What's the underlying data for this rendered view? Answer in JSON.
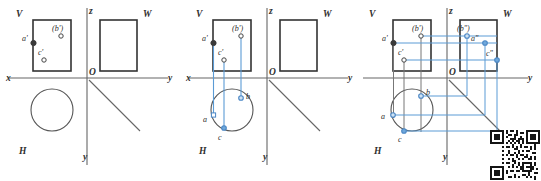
{
  "figure": {
    "type": "orthographic-projection-diagram",
    "panel_count": 3
  },
  "axis_labels": {
    "x": "x",
    "y_right": "y",
    "y_down": "y",
    "z": "z",
    "origin": "O"
  },
  "plane_labels": {
    "v": "V",
    "h": "H",
    "w": "W"
  },
  "panels": [
    {
      "id": "panel-1",
      "name": "initial-projection",
      "points": [
        {
          "id": "a-prime",
          "label": "a'",
          "style": "filled"
        },
        {
          "id": "b-prime",
          "label": "(b')",
          "style": "hollow"
        },
        {
          "id": "c-prime",
          "label": "c'",
          "style": "hollow"
        }
      ],
      "shapes": [
        "v-rectangle",
        "w-rectangle",
        "h-circle"
      ],
      "projection_lines": []
    },
    {
      "id": "panel-2",
      "name": "horizontal-projection-added",
      "points": [
        {
          "id": "a-prime",
          "label": "a'",
          "style": "filled"
        },
        {
          "id": "b-prime",
          "label": "(b')",
          "style": "hollow"
        },
        {
          "id": "c-prime",
          "label": "c'",
          "style": "hollow"
        },
        {
          "id": "a",
          "label": "a",
          "style": "blue-hollow"
        },
        {
          "id": "b",
          "label": "b",
          "style": "blue-hollow"
        },
        {
          "id": "c",
          "label": "c",
          "style": "blue-filled"
        }
      ],
      "shapes": [
        "v-rectangle",
        "w-rectangle",
        "h-circle"
      ],
      "projection_lines": [
        "vertical-a",
        "vertical-b",
        "vertical-c"
      ]
    },
    {
      "id": "panel-3",
      "name": "profile-projection-added",
      "points": [
        {
          "id": "a-prime",
          "label": "a'",
          "style": "filled"
        },
        {
          "id": "b-prime",
          "label": "(b')",
          "style": "hollow"
        },
        {
          "id": "c-prime",
          "label": "c'",
          "style": "hollow"
        },
        {
          "id": "a",
          "label": "a",
          "style": "blue-hollow"
        },
        {
          "id": "b",
          "label": "b",
          "style": "blue-hollow"
        },
        {
          "id": "c",
          "label": "c",
          "style": "blue-filled"
        },
        {
          "id": "a-double-prime",
          "label": "a\"",
          "style": "blue-hollow"
        },
        {
          "id": "b-double-prime",
          "label": "(b\")",
          "style": "blue-hollow"
        },
        {
          "id": "c-double-prime",
          "label": "c\"",
          "style": "blue-hollow"
        }
      ],
      "shapes": [
        "v-rectangle",
        "w-rectangle",
        "h-circle"
      ],
      "projection_lines": [
        "vertical-a",
        "vertical-b",
        "vertical-c",
        "horizontal-a",
        "horizontal-b",
        "horizontal-c",
        "miter-transfer"
      ]
    }
  ],
  "colors": {
    "line": "#555555",
    "outline": "#3a3a3a",
    "projection": "#5b9bd5",
    "point_fill": "#3a3a3a",
    "background": "#ffffff"
  },
  "qr_code": {
    "present": true,
    "name": "qr-code",
    "position": "bottom-right"
  }
}
